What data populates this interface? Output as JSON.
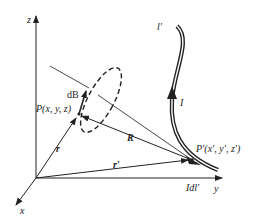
{
  "diagram": {
    "colors": {
      "ink": "#222222",
      "background": "#ffffff"
    },
    "axes": {
      "z_label": "z",
      "y_label": "y",
      "x_label": "x"
    },
    "points": {
      "field_point_label": "P(x, y, z)",
      "source_point_label": "P′(x′, y′, z′)"
    },
    "vectors": {
      "r_label": "r",
      "r_prime_label": "r′",
      "R_label": "R",
      "dB_label": "dB",
      "current_element_label": "Idl′"
    },
    "current": {
      "wire_label": "l′",
      "current_label": "I"
    }
  }
}
